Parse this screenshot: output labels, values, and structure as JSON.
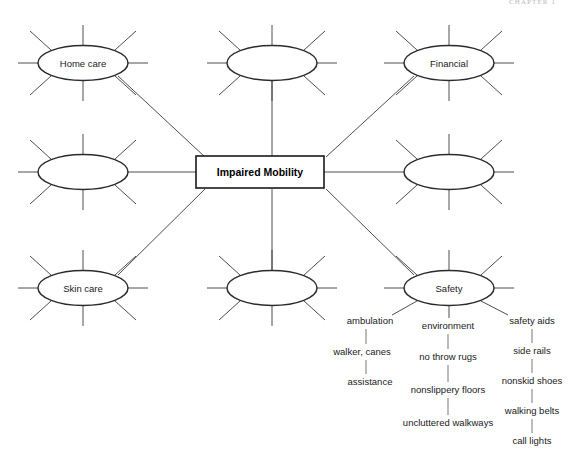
{
  "page": {
    "header_text": "CHAPTER 1"
  },
  "center": {
    "label": "Impaired Mobility",
    "x": 260,
    "y": 172,
    "width": 128,
    "height": 32
  },
  "nodes": [
    {
      "id": "home-care",
      "label": "Home care",
      "x": 83,
      "y": 63,
      "rx": 45,
      "ry": 17.5
    },
    {
      "id": "top-middle",
      "label": "",
      "x": 272,
      "y": 63,
      "rx": 45,
      "ry": 17.5
    },
    {
      "id": "financial",
      "label": "Financial",
      "x": 449,
      "y": 63,
      "rx": 45,
      "ry": 17.5
    },
    {
      "id": "left-middle",
      "label": "",
      "x": 83,
      "y": 172,
      "rx": 45,
      "ry": 17.5
    },
    {
      "id": "right-middle",
      "label": "",
      "x": 449,
      "y": 172,
      "rx": 45,
      "ry": 17.5
    },
    {
      "id": "skin-care",
      "label": "Skin care",
      "x": 83,
      "y": 288,
      "rx": 45,
      "ry": 17.5
    },
    {
      "id": "bottom-middle",
      "label": "",
      "x": 272,
      "y": 288,
      "rx": 45,
      "ry": 17.5
    },
    {
      "id": "safety",
      "label": "Safety",
      "x": 449,
      "y": 288,
      "rx": 45,
      "ry": 17.5
    }
  ],
  "branches": [
    {
      "id": "ambulation",
      "items": [
        {
          "label": "ambulation",
          "x": 370,
          "y": 321,
          "anchor": "middle"
        },
        {
          "label": "walker, canes",
          "x": 362,
          "y": 352,
          "anchor": "middle"
        },
        {
          "label": "assistance",
          "x": 370,
          "y": 382,
          "anchor": "middle"
        }
      ]
    },
    {
      "id": "environment",
      "items": [
        {
          "label": "environment",
          "x": 448,
          "y": 326,
          "anchor": "middle"
        },
        {
          "label": "no throw rugs",
          "x": 448,
          "y": 357,
          "anchor": "middle"
        },
        {
          "label": "nonslippery floors",
          "x": 448,
          "y": 390,
          "anchor": "middle"
        },
        {
          "label": "uncluttered walkways",
          "x": 448,
          "y": 423,
          "anchor": "middle"
        }
      ]
    },
    {
      "id": "safety-aids",
      "items": [
        {
          "label": "safety aids",
          "x": 532,
          "y": 321,
          "anchor": "middle"
        },
        {
          "label": "side rails",
          "x": 532,
          "y": 351,
          "anchor": "middle"
        },
        {
          "label": "nonskid shoes",
          "x": 532,
          "y": 381,
          "anchor": "middle"
        },
        {
          "label": "walking belts",
          "x": 532,
          "y": 411,
          "anchor": "middle"
        },
        {
          "label": "call lights",
          "x": 532,
          "y": 441,
          "anchor": "middle"
        }
      ]
    }
  ],
  "colors": {
    "stroke": "#2b2b2b",
    "ray": "#3a3a3a",
    "twig": "#6a6a6a",
    "text": "#1a1a1a",
    "background": "#ffffff",
    "header": "#b9b9b9"
  }
}
